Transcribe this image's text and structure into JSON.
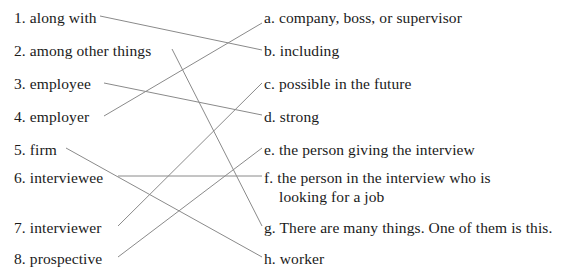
{
  "exercise": {
    "left_items": [
      {
        "label": "1.",
        "text": "along with",
        "y": 8
      },
      {
        "label": "2.",
        "text": "among other things",
        "y": 41
      },
      {
        "label": "3.",
        "text": "employee",
        "y": 74
      },
      {
        "label": "4.",
        "text": "employer",
        "y": 107
      },
      {
        "label": "5.",
        "text": "firm",
        "y": 140
      },
      {
        "label": "6.",
        "text": "interviewee",
        "y": 168
      },
      {
        "label": "7.",
        "text": "interviewer",
        "y": 218
      },
      {
        "label": "8.",
        "text": "prospective",
        "y": 249
      }
    ],
    "right_items": [
      {
        "label": "a.",
        "text": "company, boss, or supervisor",
        "y": 8
      },
      {
        "label": "b.",
        "text": "including",
        "y": 41
      },
      {
        "label": "c.",
        "text": "possible in the future",
        "y": 74
      },
      {
        "label": "d.",
        "text": "strong",
        "y": 107
      },
      {
        "label": "e.",
        "text": "the person giving the interview",
        "y": 140
      },
      {
        "label": "f.",
        "text": "the person in the interview who is",
        "text2": "looking for a job",
        "y": 168
      },
      {
        "label": "g.",
        "text": "There are many things. One of them is this.",
        "y": 218
      },
      {
        "label": "h.",
        "text": "worker",
        "y": 249
      }
    ],
    "connectors": [
      {
        "from": "1",
        "to": "b",
        "x1": 100,
        "y1": 16,
        "x2": 262,
        "y2": 50
      },
      {
        "from": "2",
        "to": "g",
        "x1": 172,
        "y1": 49,
        "x2": 262,
        "y2": 226
      },
      {
        "from": "3",
        "to": "d",
        "x1": 104,
        "y1": 83,
        "x2": 262,
        "y2": 115
      },
      {
        "from": "4",
        "to": "a",
        "x1": 104,
        "y1": 116,
        "x2": 262,
        "y2": 23
      },
      {
        "from": "5",
        "to": "e",
        "x1": 66,
        "y1": 148,
        "x2": 262,
        "y2": 257
      },
      {
        "from": "6",
        "to": "f",
        "x1": 118,
        "y1": 176,
        "x2": 262,
        "y2": 176
      },
      {
        "from": "7",
        "to": "c",
        "x1": 118,
        "y1": 226,
        "x2": 262,
        "y2": 83
      },
      {
        "from": "8",
        "to": "h",
        "x1": 118,
        "y1": 257,
        "x2": 262,
        "y2": 148
      }
    ],
    "line_color": "#8a8a8a"
  }
}
